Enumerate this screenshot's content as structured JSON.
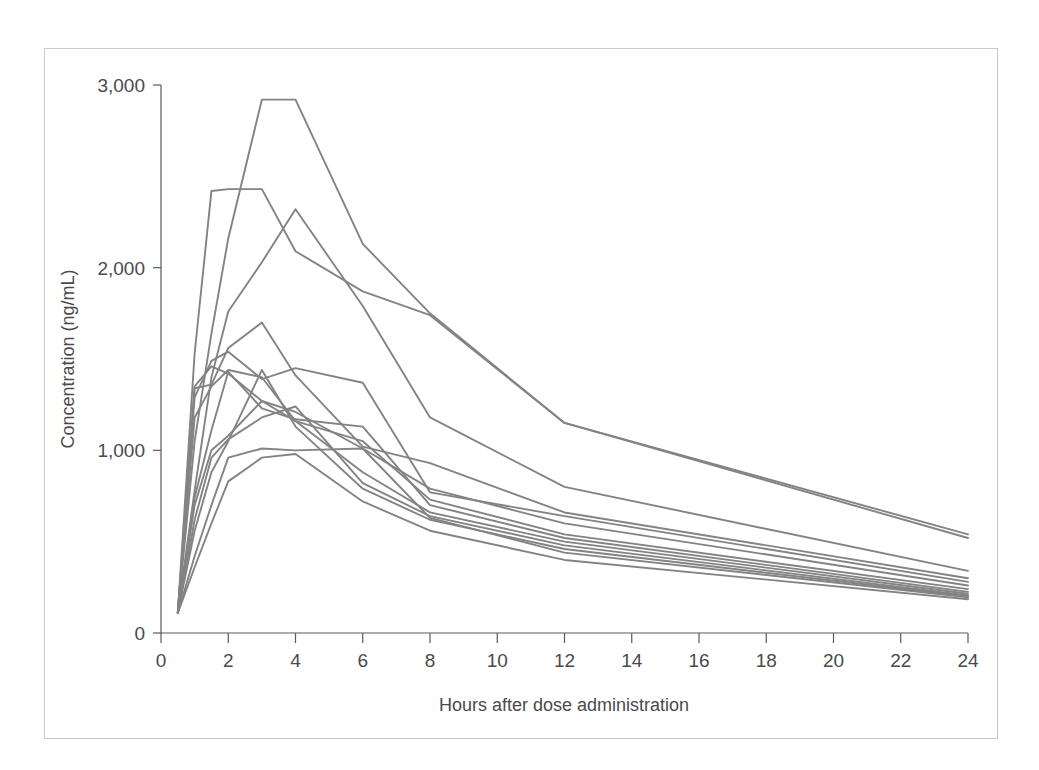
{
  "figure": {
    "background_color": "#ffffff",
    "frame_color": "#c9c9c9",
    "line_color": "#838383",
    "axis_color": "#5a5a5a"
  },
  "axes": {
    "x_title": "Hours after dose administration",
    "y_title": "Concentration (ng/mL)",
    "x_ticks": [
      "0",
      "2",
      "4",
      "6",
      "8",
      "10",
      "12",
      "14",
      "16",
      "18",
      "20",
      "22",
      "24"
    ],
    "y_ticks": [
      "0",
      "1,000",
      "2,000",
      "3,000"
    ]
  },
  "chart_data": {
    "type": "line",
    "title": "",
    "subtitle": "",
    "xlabel": "Hours after dose administration",
    "ylabel": "Concentration (ng/mL)",
    "xlim": [
      0,
      24
    ],
    "ylim": [
      0,
      3000
    ],
    "xticks": [
      0,
      2,
      4,
      6,
      8,
      10,
      12,
      14,
      16,
      18,
      20,
      22,
      24
    ],
    "yticks": [
      0,
      1000,
      2000,
      3000
    ],
    "grid": false,
    "legend": "none",
    "annotations": [],
    "x": [
      0.5,
      1,
      1.5,
      2,
      3,
      4,
      6,
      8,
      12,
      24
    ],
    "series": [
      {
        "name": "subject-01",
        "values": [
          110,
          1050,
          1640,
          2160,
          2920,
          2920,
          2130,
          1750,
          1150,
          540
        ]
      },
      {
        "name": "subject-02",
        "values": [
          110,
          1530,
          2420,
          2430,
          2430,
          2090,
          1870,
          1740,
          1150,
          520
        ]
      },
      {
        "name": "subject-03",
        "values": [
          110,
          780,
          1400,
          1760,
          2030,
          2320,
          1790,
          1180,
          800,
          340
        ]
      },
      {
        "name": "subject-04",
        "values": [
          110,
          1340,
          1360,
          1560,
          1700,
          1410,
          1020,
          930,
          660,
          300
        ]
      },
      {
        "name": "subject-05",
        "values": [
          110,
          1290,
          1490,
          1540,
          1390,
          1450,
          1370,
          770,
          640,
          280
        ]
      },
      {
        "name": "subject-06",
        "values": [
          110,
          1350,
          1460,
          1420,
          1270,
          1210,
          1010,
          790,
          600,
          260
        ]
      },
      {
        "name": "subject-07",
        "values": [
          110,
          1180,
          1350,
          1440,
          1400,
          1160,
          1050,
          730,
          540,
          240
        ]
      },
      {
        "name": "subject-08",
        "values": [
          110,
          740,
          1110,
          1430,
          1230,
          1170,
          1130,
          700,
          520,
          225
        ]
      },
      {
        "name": "subject-09",
        "values": [
          110,
          700,
          1000,
          1080,
          1270,
          1160,
          880,
          660,
          500,
          215
        ]
      },
      {
        "name": "subject-10",
        "values": [
          110,
          620,
          960,
          1060,
          1180,
          1240,
          820,
          640,
          480,
          205
        ]
      },
      {
        "name": "subject-11",
        "values": [
          110,
          560,
          880,
          1050,
          1440,
          1130,
          790,
          620,
          460,
          200
        ]
      },
      {
        "name": "subject-12",
        "values": [
          110,
          420,
          700,
          960,
          1010,
          1000,
          1010,
          630,
          440,
          195
        ]
      },
      {
        "name": "subject-13",
        "values": [
          110,
          360,
          600,
          830,
          960,
          980,
          720,
          560,
          400,
          185
        ]
      }
    ]
  }
}
